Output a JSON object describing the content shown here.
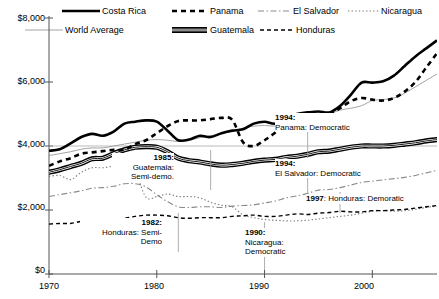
{
  "chart_data": {
    "type": "line",
    "title": "",
    "xlabel": "",
    "ylabel": "",
    "xlim": [
      1970,
      2006
    ],
    "ylim": [
      0,
      8000
    ],
    "grid": false,
    "legend_position": "top",
    "y_ticks": [
      "$0",
      "$2,000",
      "$4,000",
      "$6,000",
      "$8,000"
    ],
    "y_tick_values": [
      0,
      2000,
      4000,
      6000,
      8000
    ],
    "x_ticks": [
      "1970",
      "1980",
      "1990",
      "2000"
    ],
    "x_tick_values": [
      1970,
      1980,
      1990,
      2000
    ],
    "x": [
      1970,
      1971,
      1972,
      1973,
      1974,
      1975,
      1976,
      1977,
      1978,
      1979,
      1980,
      1981,
      1982,
      1983,
      1984,
      1985,
      1986,
      1987,
      1988,
      1989,
      1990,
      1991,
      1992,
      1993,
      1994,
      1995,
      1996,
      1997,
      1998,
      1999,
      2000,
      2001,
      2002,
      2003,
      2004,
      2005,
      2006
    ],
    "series": [
      {
        "name": "Costa Rica",
        "style": "thick-solid-black",
        "color": "#000000",
        "values": [
          3850,
          3900,
          4080,
          4280,
          4380,
          4320,
          4450,
          4700,
          4760,
          4800,
          4760,
          4480,
          4180,
          4200,
          4320,
          4280,
          4400,
          4480,
          4520,
          4700,
          4760,
          4700,
          4880,
          5000,
          5050,
          5080,
          5050,
          5250,
          5600,
          5980,
          5980,
          6020,
          6200,
          6500,
          6800,
          7050,
          7300
        ]
      },
      {
        "name": "Panama",
        "style": "thick-dashed-black",
        "color": "#000000",
        "values": [
          3380,
          3520,
          3620,
          3760,
          3800,
          3840,
          3880,
          3880,
          4060,
          4180,
          4400,
          4620,
          4780,
          4800,
          4800,
          4840,
          4880,
          4820,
          4120,
          4000,
          4180,
          4420,
          4700,
          4820,
          4880,
          4920,
          5000,
          5180,
          5400,
          5500,
          5450,
          5420,
          5500,
          5700,
          6000,
          6450,
          6900
        ]
      },
      {
        "name": "El Salvador",
        "style": "dashdot-gray",
        "color": "#8a8a8a",
        "values": [
          2420,
          2480,
          2540,
          2600,
          2680,
          2700,
          2740,
          2820,
          2820,
          2720,
          2480,
          2260,
          2100,
          2080,
          2100,
          2100,
          2080,
          2120,
          2140,
          2160,
          2220,
          2280,
          2380,
          2440,
          2520,
          2620,
          2640,
          2700,
          2780,
          2860,
          2900,
          2940,
          2980,
          3020,
          3080,
          3160,
          3240
        ]
      },
      {
        "name": "Nicaragua",
        "style": "dotted-gray",
        "color": "#7a7a7a",
        "values": [
          3050,
          3080,
          2950,
          3180,
          3320,
          3320,
          3380,
          3500,
          3200,
          2400,
          2420,
          2500,
          2420,
          2420,
          2380,
          2240,
          2150,
          2100,
          1850,
          1760,
          1700,
          1680,
          1660,
          1660,
          1680,
          1720,
          1760,
          1800,
          1840,
          1900,
          1960,
          1980,
          1960,
          1980,
          2020,
          2080,
          2120
        ]
      },
      {
        "name": "World Average",
        "style": "thin-solid-gray",
        "color": "#9a9a9a",
        "values": [
          3700,
          3760,
          3820,
          3900,
          3940,
          3940,
          4000,
          4060,
          4120,
          4180,
          4200,
          4180,
          4140,
          4180,
          4260,
          4320,
          4380,
          4460,
          4560,
          4620,
          4640,
          4620,
          4660,
          4720,
          4820,
          4900,
          5000,
          5120,
          5180,
          5260,
          5420,
          5450,
          5500,
          5650,
          5850,
          6050,
          6250
        ]
      },
      {
        "name": "Guatemala",
        "style": "double-band-black",
        "color": "#000000",
        "values": [
          3180,
          3260,
          3360,
          3460,
          3600,
          3620,
          3760,
          3880,
          3960,
          3980,
          3960,
          3820,
          3620,
          3540,
          3500,
          3440,
          3400,
          3420,
          3460,
          3520,
          3560,
          3580,
          3640,
          3680,
          3740,
          3820,
          3840,
          3900,
          3960,
          4000,
          4000,
          4000,
          4020,
          4060,
          4100,
          4160,
          4200
        ]
      },
      {
        "name": "Honduras",
        "style": "dashed-black",
        "color": "#000000",
        "values": [
          1560,
          1580,
          1580,
          1640,
          1620,
          1600,
          1660,
          1740,
          1800,
          1840,
          1840,
          1820,
          1760,
          1740,
          1760,
          1760,
          1760,
          1800,
          1820,
          1840,
          1800,
          1800,
          1840,
          1880,
          1860,
          1900,
          1920,
          1960,
          1940,
          1940,
          1980,
          1980,
          2000,
          2020,
          2060,
          2100,
          2140
        ]
      }
    ],
    "annotations": [
      {
        "id": "panama-1994",
        "year": "1994",
        "text": "Panama: Democratic",
        "align": "left",
        "x_year": 1994
      },
      {
        "id": "guatemala-1985",
        "year": "1985",
        "text": "Guatemala:\nSemi-demo.",
        "align": "right",
        "x_year": 1985
      },
      {
        "id": "elsalvador-1994",
        "year": "1994",
        "text": "El Salvador: Democratic",
        "align": "left",
        "x_year": 1994
      },
      {
        "id": "honduras-1997",
        "year": "1997",
        "text": "Honduras: Demoratic",
        "align": "left",
        "x_year": 1997
      },
      {
        "id": "honduras-1982",
        "year": "1982",
        "text": "Honduras: Semi-\nDemo",
        "align": "right",
        "x_year": 1982
      },
      {
        "id": "nicaragua-1990",
        "year": "1990",
        "text": "Nicaragua:\nDemocratic",
        "align": "left",
        "x_year": 1990
      }
    ]
  },
  "legend": {
    "items": [
      {
        "label": "Costa Rica",
        "style": "thick-solid-black"
      },
      {
        "label": "Panama",
        "style": "thick-dashed-black"
      },
      {
        "label": "El Salvador",
        "style": "dashdot-gray"
      },
      {
        "label": "Nicaragua",
        "style": "dotted-gray"
      },
      {
        "label": "World Average",
        "style": "thin-solid-gray"
      },
      {
        "label": "Guatemala",
        "style": "double-band-black"
      },
      {
        "label": "Honduras",
        "style": "dashed-black"
      }
    ]
  },
  "annotation_labels": {
    "panama_1994_year": "1994:",
    "panama_1994_body": "Panama: Democratic",
    "guatemala_1985_year": "1985:",
    "guatemala_1985_body_1": "Guatemala:",
    "guatemala_1985_body_2": "Semi-demo.",
    "elsalvador_1994_year": "1994:",
    "elsalvador_1994_body": "El Salvador: Democratic",
    "honduras_1997_year": "1997",
    "honduras_1997_body": ": Honduras: Demoratic",
    "honduras_1982_year": "1982:",
    "honduras_1982_body_1": "Honduras: Semi-",
    "honduras_1982_body_2": "Demo",
    "nicaragua_1990_year": "1990:",
    "nicaragua_1990_body_1": "Nicaragua:",
    "nicaragua_1990_body_2": "Democratic"
  },
  "axis": {
    "y_labels": [
      "$8,000",
      "$6,000",
      "$4,000",
      "$2,000",
      "$0"
    ],
    "x_labels": [
      "1970",
      "1980",
      "1990",
      "2000"
    ]
  },
  "colors": {
    "ink": "#000000",
    "gray_line": "#9a9a9a",
    "axis": "#555555",
    "background": "#ffffff"
  }
}
